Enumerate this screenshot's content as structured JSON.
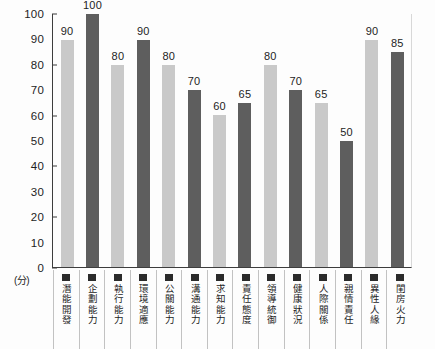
{
  "chart_data": {
    "type": "bar",
    "title": "",
    "xlabel": "",
    "ylabel": "(分)",
    "ylim": [
      0,
      100
    ],
    "ytick_step": 10,
    "grid": false,
    "legend_position": "bottom",
    "categories": [
      "潛能開發",
      "企劃能力",
      "執行能力",
      "環境適應",
      "公關能力",
      "溝通能力",
      "求知能力",
      "責任態度",
      "領導統御",
      "健康狀況",
      "人際關係",
      "親情責任",
      "異性人緣",
      "閨房火力"
    ],
    "values": [
      90,
      100,
      80,
      90,
      80,
      70,
      60,
      65,
      80,
      70,
      65,
      50,
      90,
      85
    ],
    "bar_colors": [
      "#c9c9c9",
      "#5e5e5e",
      "#c9c9c9",
      "#5e5e5e",
      "#c9c9c9",
      "#5e5e5e",
      "#c9c9c9",
      "#5e5e5e",
      "#c9c9c9",
      "#5e5e5e",
      "#c9c9c9",
      "#5e5e5e",
      "#c9c9c9",
      "#5e5e5e"
    ],
    "ytick_labels": [
      "100",
      "90",
      "80",
      "70",
      "60",
      "50",
      "40",
      "30",
      "20",
      "10",
      "0"
    ],
    "ytick_values": [
      100,
      90,
      80,
      70,
      60,
      50,
      40,
      30,
      20,
      10,
      0
    ],
    "ytick_marks": [
      100,
      80,
      60,
      40,
      20,
      0
    ],
    "legend_swatch_color": "#2b2b2b",
    "axis_color": "#3d3d3d"
  }
}
